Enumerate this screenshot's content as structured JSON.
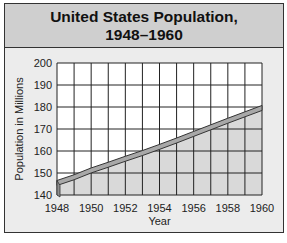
{
  "chart_data": {
    "type": "area",
    "title": "United States Population,",
    "subtitle": "1948–1960",
    "xlabel": "Year",
    "ylabel": "Population in Millions",
    "x": [
      1948,
      1949,
      1950,
      1951,
      1952,
      1953,
      1954,
      1955,
      1956,
      1957,
      1958,
      1959,
      1960
    ],
    "series": [
      {
        "name": "Population",
        "values": [
          146.6,
          149.2,
          152.3,
          154.9,
          157.6,
          160.2,
          163.0,
          165.9,
          168.9,
          171.9,
          174.9,
          177.8,
          180.7
        ]
      }
    ],
    "x_tick_labels": [
      "1948",
      "1950",
      "1952",
      "1954",
      "1956",
      "1958",
      "1960"
    ],
    "y_tick_labels": [
      "140",
      "150",
      "160",
      "170",
      "180",
      "190",
      "200"
    ],
    "ylim": [
      140,
      200
    ],
    "xlim": [
      1948,
      1960
    ],
    "grid": true,
    "style": "3d-ribbon area",
    "colors": {
      "title_bg": "#cfcfcf",
      "panel_bg": "#ececec",
      "area": "#d9d9d9",
      "ribbon": "#a8a8a8",
      "grid": "#222222"
    }
  }
}
